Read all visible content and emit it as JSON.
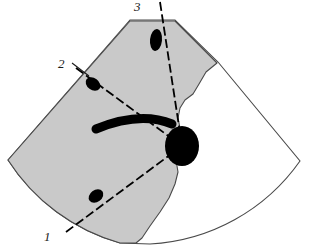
{
  "figure": {
    "type": "medical-ultrasound-sector-diagram",
    "canvas": {
      "width": 310,
      "height": 249
    },
    "colors": {
      "background": "#ffffff",
      "shaded_region_fill": "#c9c9c9",
      "outline_stroke": "#3c3c3c",
      "lesion_fill": "#000000",
      "trajectory_stroke": "#000000",
      "label_color": "#1a1a1a"
    },
    "sector": {
      "name": "ultrasound-sector-outline",
      "apex": {
        "x": 152,
        "y": 20
      },
      "description": "fan-shaped scan field with curved far-field arc"
    },
    "shaded_region": {
      "name": "anatomical-shaded-region",
      "description": "gray shaded tissue region occupying left portion of the sector"
    },
    "lesion": {
      "name": "target-lesion",
      "label": "",
      "center": {
        "x": 182,
        "y": 146
      },
      "rx": 17,
      "ry": 20
    },
    "curved_band": {
      "name": "curved-echogenic-band",
      "description": "thick black curved band crossing the mid field"
    },
    "trajectories": [
      {
        "id": "1",
        "label": "1",
        "name": "trajectory-line-1",
        "label_position": {
          "x": 44,
          "y": 230
        },
        "start": {
          "x": 66,
          "y": 232
        },
        "end": {
          "x": 182,
          "y": 146
        },
        "marker": {
          "x": 96,
          "y": 196,
          "rx": 8,
          "ry": 6,
          "angle": -37
        },
        "style": "dashed"
      },
      {
        "id": "2",
        "label": "2",
        "name": "trajectory-line-2",
        "label_position": {
          "x": 58,
          "y": 57
        },
        "leader_start": {
          "x": 72,
          "y": 64
        },
        "leader_end": {
          "x": 88,
          "y": 75
        },
        "start": {
          "x": 76,
          "y": 68
        },
        "end": {
          "x": 182,
          "y": 146
        },
        "marker": {
          "x": 93,
          "y": 84,
          "rx": 8,
          "ry": 6,
          "angle": 36
        },
        "style": "dashed"
      },
      {
        "id": "3",
        "label": "3",
        "name": "trajectory-line-3",
        "label_position": {
          "x": 134,
          "y": 0
        },
        "start": {
          "x": 160,
          "y": 2
        },
        "end": {
          "x": 182,
          "y": 146
        },
        "marker": {
          "x": 156,
          "y": 40,
          "rx": 6,
          "ry": 11,
          "angle": 6
        },
        "style": "dashed"
      }
    ]
  }
}
